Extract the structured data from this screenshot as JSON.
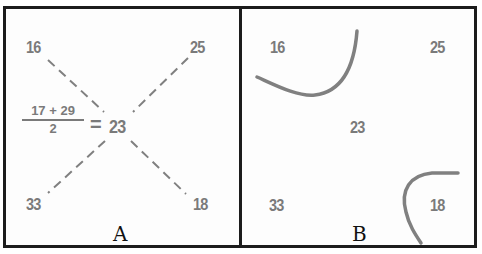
{
  "panels": {
    "a": {
      "label": "A",
      "corners": {
        "top_left": "16",
        "top_right": "25",
        "bottom_left": "33",
        "bottom_right": "18"
      },
      "center": "23",
      "formula": {
        "numerator": "17 + 29",
        "denominator": "2",
        "equals": "="
      }
    },
    "b": {
      "label": "B",
      "corners": {
        "top_left": "16",
        "top_right": "25",
        "bottom_left": "33",
        "bottom_right": "18"
      },
      "center": "23"
    }
  },
  "colors": {
    "border": "#1c1c1c",
    "text": "#7a7a7a",
    "lines": "#808080",
    "label": "#111111"
  }
}
